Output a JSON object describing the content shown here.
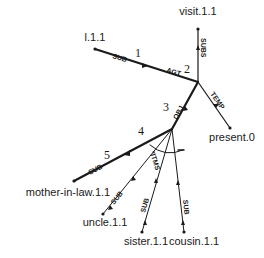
{
  "diagram": {
    "nodes": {
      "visit": "visit.1.1",
      "l": "l.1.1",
      "present": "present.0",
      "mother_in_law": "mother-in-law.1.1",
      "uncle": "uncle.1.1",
      "sister": "sister.1.1",
      "cousin": "cousin.1.1"
    },
    "edges": {
      "sub_l": "SUB",
      "agt": "AGT",
      "subs": "SUBS",
      "temp": "TEMP",
      "obj": "OBJ",
      "sub_mother": "SUB",
      "sub_uncle": "SUB",
      "itms": "*ITMS",
      "sub_sister": "SUB",
      "sub_cousin": "SUB"
    },
    "numbers": {
      "n1": "1",
      "n2": "2",
      "n3": "3",
      "n4": "4",
      "n5": "5"
    },
    "colors": {
      "line": "#1a1a1a",
      "background": "#ffffff"
    }
  }
}
